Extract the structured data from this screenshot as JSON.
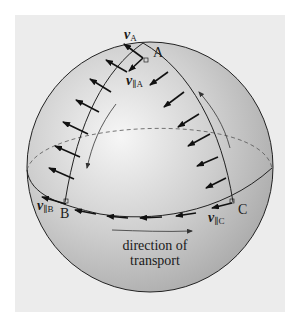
{
  "figure": {
    "type": "parallel transport on a sphere",
    "background_color": "#ececec",
    "sphere_color": "#bdbdbd",
    "highlight_color": "#f4f4f4",
    "stroke_color": "#1a1a1a"
  },
  "labels": {
    "vA_main": "v",
    "vA_sub": "A",
    "vparA_main": "v",
    "vparA_sub": "∥A",
    "vparB_main": "v",
    "vparB_sub": "∥B",
    "vparC_main": "v",
    "vparC_sub": "∥C",
    "point_A": "A",
    "point_B": "B",
    "point_C": "C",
    "caption_line1": "direction of",
    "caption_line2": "transport"
  },
  "icons": {
    "transport_arrow": "arrow-right",
    "path_arrows": [
      "arrow-down-along-AB",
      "arrow-up-along-CA"
    ]
  }
}
